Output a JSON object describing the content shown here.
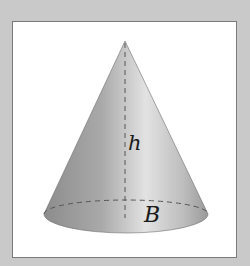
{
  "diagram": {
    "type": "cone",
    "labels": {
      "height": "h",
      "base": "B"
    },
    "colors": {
      "background": "#c9c9c9",
      "frame": "#ffffff",
      "frame_border": "#7a7a7a",
      "cone_dark": "#8e8e8e",
      "cone_light": "#e6e6e6",
      "dash": "#555555"
    }
  }
}
